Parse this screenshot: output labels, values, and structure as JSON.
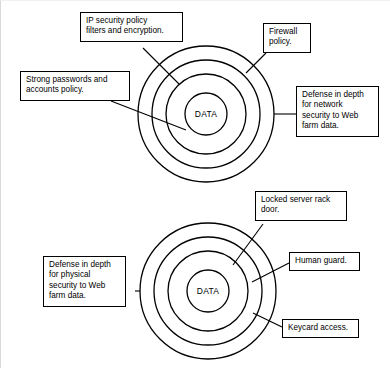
{
  "figure": {
    "background_color": "#ffffff",
    "stroke_color": "#000000",
    "core_label": "DATA"
  },
  "diagrams": [
    {
      "id": "network-security",
      "core_label": "DATA",
      "ring_count": 4,
      "callouts": [
        {
          "id": "ip-security-policy",
          "text": "IP security policy\nfilters and encryption."
        },
        {
          "id": "firewall-policy",
          "text": "Firewall\npolicy."
        },
        {
          "id": "strong-passwords",
          "text": "Strong passwords and\naccounts policy."
        },
        {
          "id": "defense-in-depth-network",
          "text": "Defense in depth\nfor network\nsecurity to Web\nfarm data."
        }
      ]
    },
    {
      "id": "physical-security",
      "core_label": "DATA",
      "ring_count": 4,
      "callouts": [
        {
          "id": "locked-server-rack-door",
          "text": "Locked server rack\ndoor."
        },
        {
          "id": "human-guard",
          "text": "Human guard."
        },
        {
          "id": "keycard-access",
          "text": "Keycard access."
        },
        {
          "id": "defense-in-depth-physical",
          "text": "Defense in depth\nfor physical\nsecurity to Web\nfarm data."
        }
      ]
    }
  ]
}
